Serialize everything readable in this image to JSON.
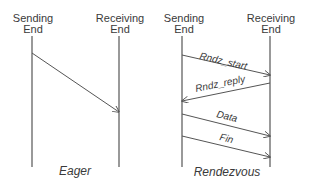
{
  "diagrams": [
    {
      "caption": "Eager",
      "left": {
        "line1": "Sending",
        "line2": "End"
      },
      "right": {
        "line1": "Receiving",
        "line2": "End"
      },
      "messages": []
    },
    {
      "caption": "Rendezvous",
      "left": {
        "line1": "Sending",
        "line2": "End"
      },
      "right": {
        "line1": "Receiving",
        "line2": "End"
      },
      "messages": [
        {
          "label": "Rndz_start",
          "direction": "sender-to-receiver"
        },
        {
          "label": "Rndz_reply",
          "direction": "receiver-to-sender"
        },
        {
          "label": "Data",
          "direction": "sender-to-receiver"
        },
        {
          "label": "Fin",
          "direction": "sender-to-receiver"
        }
      ]
    }
  ],
  "colors": {
    "line": "#555555",
    "text": "#3a3a3a",
    "background": "#ffffff"
  }
}
